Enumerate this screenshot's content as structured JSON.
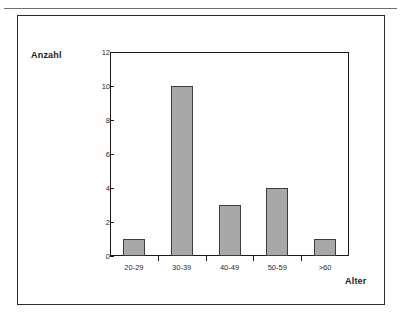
{
  "page": {
    "header_note": ""
  },
  "chart_data": {
    "type": "bar",
    "title": "",
    "xlabel": "Alter",
    "ylabel": "Anzahl",
    "categories": [
      "20-29",
      "30-39",
      "40-49",
      "50-59",
      ">60"
    ],
    "values": [
      1,
      10,
      3,
      4,
      1
    ],
    "ylim": [
      0,
      12
    ],
    "y_ticks": [
      0,
      2,
      4,
      6,
      8,
      10,
      12
    ],
    "y_tick_labels": [
      "0",
      "2",
      "4",
      "6",
      "8",
      "10",
      "12"
    ],
    "grid": false,
    "legend": false,
    "bar_color": "#a8a8a8",
    "bar_border_color": "#3d3d3d",
    "axis_color": "#1a1a1a",
    "frame_color": "#2b2b2b"
  }
}
